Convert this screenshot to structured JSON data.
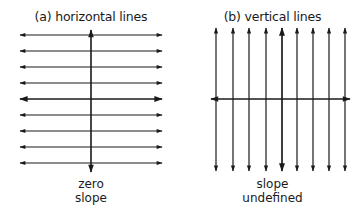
{
  "panels": {
    "a": {
      "title": "(a) horizontal lines",
      "caption_line1": "zero",
      "caption_line2": "slope"
    },
    "b": {
      "title": "(b) vertical lines",
      "caption_line1": "slope",
      "caption_line2": "undefined"
    }
  },
  "diagram": {
    "line_color": "#1a1a1a",
    "panel_a": {
      "horizontal_line_count": 9,
      "axis": "vertical"
    },
    "panel_b": {
      "vertical_line_count": 9,
      "axis": "horizontal"
    }
  }
}
